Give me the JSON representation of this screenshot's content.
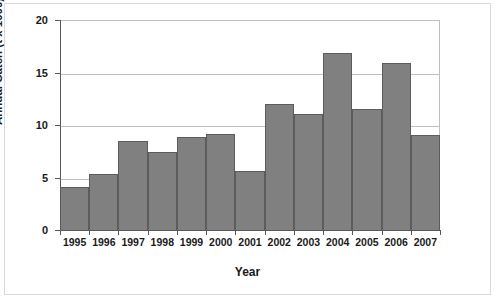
{
  "chart_data": {
    "type": "bar",
    "title": "",
    "xlabel": "Year",
    "ylabel": "Annual Catch (t x 1000)",
    "categories": [
      "1995",
      "1996",
      "1997",
      "1998",
      "1999",
      "2000",
      "2001",
      "2002",
      "2003",
      "2004",
      "2005",
      "2006",
      "2007"
    ],
    "values": [
      4.2,
      5.4,
      8.6,
      7.5,
      9.0,
      9.2,
      5.7,
      12.1,
      11.1,
      17.0,
      11.6,
      16.0,
      9.1
    ],
    "ylim": [
      0,
      20
    ],
    "yticks": [
      0,
      5,
      10,
      15,
      20
    ],
    "ytick_labels": [
      "0",
      "5",
      "10",
      "15",
      "20"
    ],
    "grid": "horizontal",
    "legend": "none",
    "series_color": "#808080",
    "series_border_color": "#5c5c5c",
    "grid_color": "#bfbfbf",
    "axis_color": "#595959"
  }
}
